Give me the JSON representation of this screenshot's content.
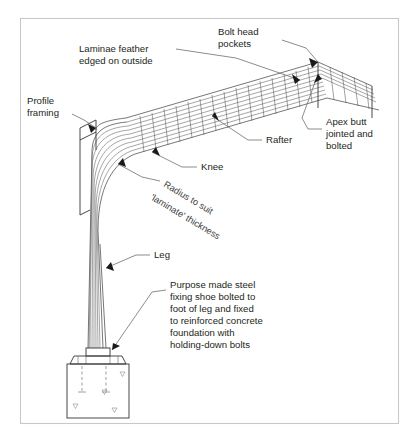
{
  "figure": {
    "background_color": "#ffffff",
    "border_color": "#c8c8c8",
    "line_color": "#4a4a4a",
    "text_color": "#231f20"
  },
  "labels": {
    "laminae_feather": "Laminae feather\nedged on outside",
    "laminae_feather_line1": "Laminae feather",
    "laminae_feather_line2": "edged on outside",
    "bolt_head_pockets_line1": "Bolt head",
    "bolt_head_pockets_line2": "pockets",
    "profile_framing_line1": "Profile",
    "profile_framing_line2": "framing",
    "rafter": "Rafter",
    "knee": "Knee",
    "leg": "Leg",
    "apex_line1": "Apex butt",
    "apex_line2": "jointed and",
    "apex_line3": "bolted",
    "radius_note": "Radius to suit",
    "radius_note2": "'laminate' thickness",
    "shoe_note_lines": [
      "Purpose made steel",
      "fixing shoe bolted to",
      "foot of leg and fixed",
      "to reinforced concrete",
      "foundation with",
      "holding-down bolts"
    ]
  },
  "components": {
    "laminate_layer_count": 10,
    "parts": [
      "rafter",
      "knee",
      "leg",
      "apex-joint",
      "profile-framing",
      "steel-fixing-shoe",
      "concrete-foundation",
      "holding-down-bolts"
    ]
  }
}
